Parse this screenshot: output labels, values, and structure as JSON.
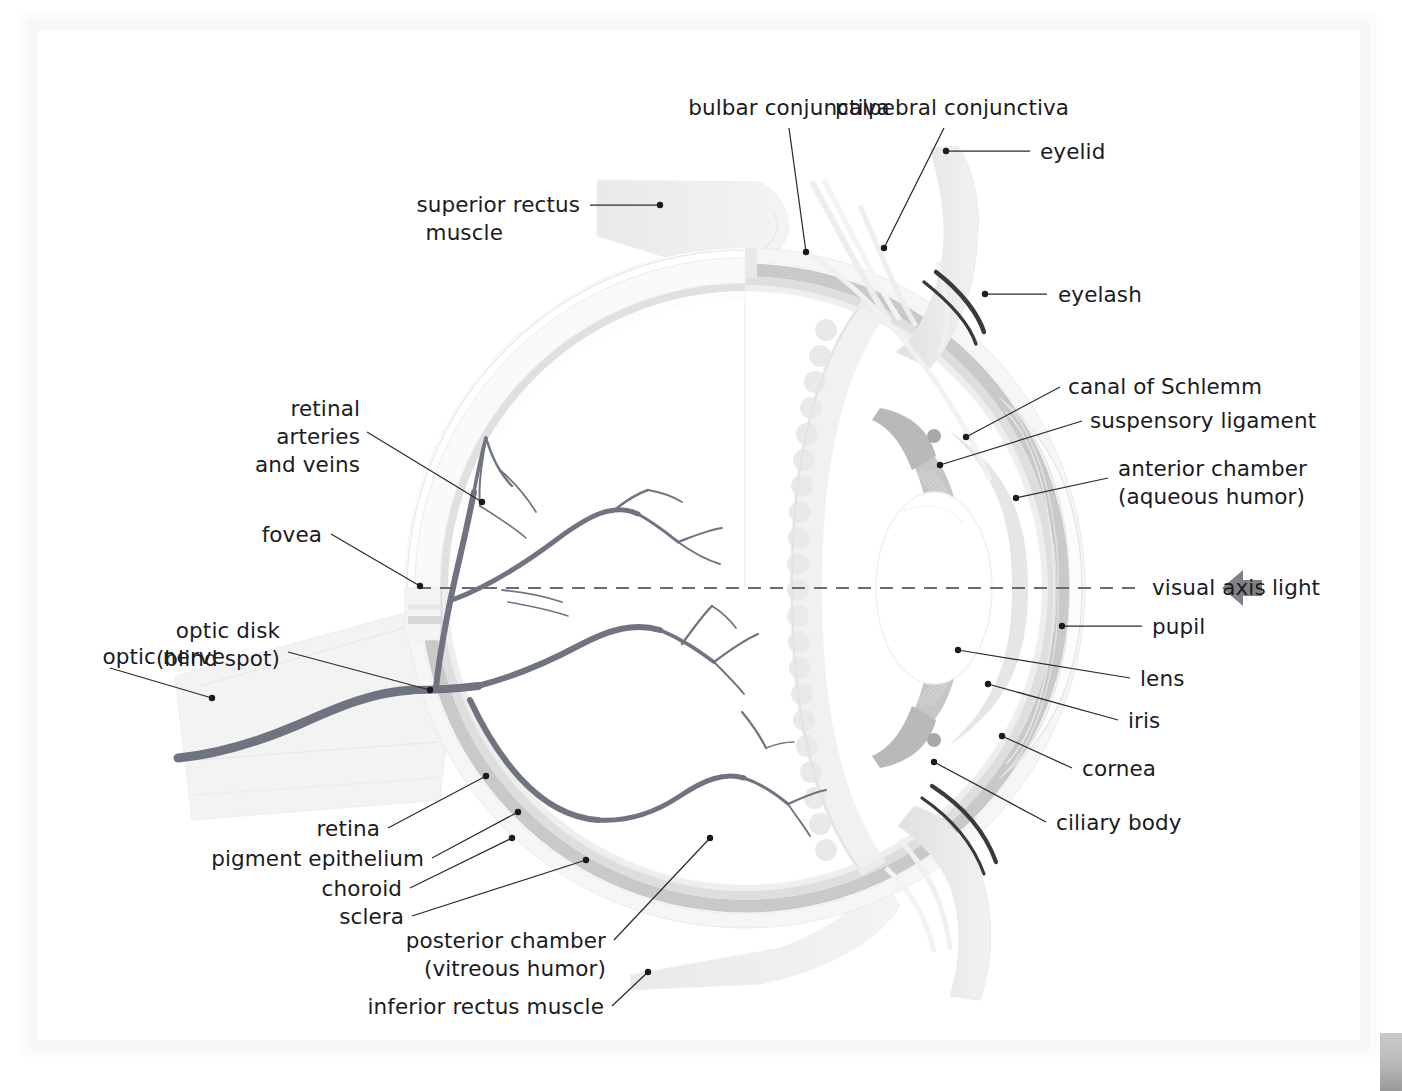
{
  "figure": {
    "type": "anatomical-diagram"
  },
  "palette": {
    "background": "#ffffff",
    "text": "#1b1b1f",
    "leader_line": "#2b2b30",
    "sclera": "#f2f2f2",
    "choroid": "#c8c8c8",
    "pigment_epithelium": "#dcdcdc",
    "retina": "#eaeaea",
    "iris": "#cfcfcf",
    "lens": "#ffffff",
    "ciliary_body": "#e2e2e2",
    "vessel": "#6f7480",
    "muscle": "#ececec",
    "eyelid": "#e4e4e4",
    "eyelash": "#3a3a3a",
    "axis_line": "#6b6b74",
    "scan_border": "#f7f7f7"
  },
  "labels": {
    "bulbar_conjunctiva": "bulbar conjunctiva",
    "palpebral_conjunctiva": "palpebral conjunctiva",
    "eyelid": "eyelid",
    "eyelash": "eyelash",
    "superior_rectus_muscle_line1": "superior rectus",
    "superior_rectus_muscle_line2": "muscle",
    "canal_of_schlemm": "canal of Schlemm",
    "suspensory_ligament": "suspensory ligament",
    "anterior_chamber_line1": "anterior chamber",
    "anterior_chamber_line2": "(aqueous humor)",
    "visual_axis": "visual axis",
    "light": "light",
    "pupil": "pupil",
    "lens": "lens",
    "iris": "iris",
    "cornea": "cornea",
    "ciliary_body": "ciliary body",
    "retinal_vessels_line1": "retinal",
    "retinal_vessels_line2": "arteries",
    "retinal_vessels_line3": "and veins",
    "fovea": "fovea",
    "optic_disk_line1": "optic disk",
    "optic_disk_line2": "(blind spot)",
    "optic_nerve": "optic nerve",
    "retina": "retina",
    "pigment_epithelium": "pigment epithelium",
    "choroid": "choroid",
    "sclera": "sclera",
    "posterior_chamber_line1": "posterior chamber",
    "posterior_chamber_line2": "(vitreous humor)",
    "inferior_rectus_muscle": "inferior rectus muscle"
  },
  "structures": [
    {
      "name": "sclera",
      "role": "outer fibrous coat"
    },
    {
      "name": "choroid",
      "role": "vascular middle coat"
    },
    {
      "name": "pigment-epithelium",
      "role": "retinal pigment layer"
    },
    {
      "name": "retina",
      "role": "neural inner coat"
    },
    {
      "name": "cornea",
      "role": "transparent anterior window"
    },
    {
      "name": "iris",
      "role": "pigmented diaphragm"
    },
    {
      "name": "pupil",
      "role": "central aperture"
    },
    {
      "name": "lens",
      "role": "refractive body"
    },
    {
      "name": "ciliary-body",
      "role": "accommodation muscle"
    },
    {
      "name": "suspensory-ligament",
      "role": "zonule fibers"
    },
    {
      "name": "canal-of-schlemm",
      "role": "aqueous drainage"
    },
    {
      "name": "anterior-chamber",
      "role": "aqueous humor space"
    },
    {
      "name": "posterior-chamber",
      "role": "vitreous humor space"
    },
    {
      "name": "optic-nerve",
      "role": "cranial nerve II"
    },
    {
      "name": "optic-disk",
      "role": "blind spot"
    },
    {
      "name": "fovea",
      "role": "area of sharpest vision"
    },
    {
      "name": "retinal-vessels",
      "role": "arteries and veins"
    },
    {
      "name": "superior-rectus-muscle",
      "role": "extraocular muscle"
    },
    {
      "name": "inferior-rectus-muscle",
      "role": "extraocular muscle"
    },
    {
      "name": "eyelid",
      "role": "palpebra"
    },
    {
      "name": "eyelash",
      "role": "cilia"
    },
    {
      "name": "bulbar-conjunctiva",
      "role": "mucous membrane over sclera"
    },
    {
      "name": "palpebral-conjunctiva",
      "role": "mucous membrane lining lid"
    }
  ]
}
